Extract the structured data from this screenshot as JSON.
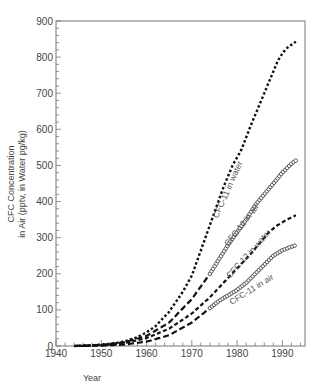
{
  "chart_data": {
    "type": "line",
    "title": "",
    "xlabel": "Year",
    "ylabel": "CFC Concentration\nin Air (pptv, in Water pg/kg)",
    "ylabel_lines": [
      "CFC Concentration",
      "in Air (pptv, in Water pg/kg)"
    ],
    "xlim": [
      1940,
      1995
    ],
    "ylim": [
      0,
      900
    ],
    "x_ticks": [
      1940,
      1950,
      1960,
      1970,
      1980,
      1990
    ],
    "y_ticks": [
      0,
      100,
      200,
      300,
      400,
      500,
      600,
      700,
      800,
      900
    ],
    "grid": false,
    "legend": "inline labels along curves",
    "series": [
      {
        "name": "CFC-11 in water",
        "style": "dotted",
        "x": [
          1944,
          1948,
          1952,
          1955,
          1958,
          1960,
          1962,
          1965,
          1968,
          1970,
          1973,
          1975,
          1977,
          1979,
          1981,
          1983,
          1985,
          1987,
          1989,
          1990,
          1991,
          1993
        ],
        "y": [
          0,
          2,
          6,
          12,
          25,
          38,
          55,
          95,
          150,
          195,
          300,
          370,
          440,
          500,
          545,
          610,
          670,
          730,
          790,
          810,
          825,
          843
        ]
      },
      {
        "name": "CFC-12 in air",
        "style": "circles",
        "x": [
          1944,
          1950,
          1955,
          1960,
          1965,
          1970,
          1972,
          1974,
          1976,
          1978,
          1980,
          1982,
          1984,
          1986,
          1988,
          1990,
          1992,
          1993
        ],
        "y": [
          0,
          3,
          10,
          28,
          65,
          130,
          165,
          200,
          240,
          280,
          315,
          350,
          390,
          420,
          450,
          480,
          505,
          514
        ]
      },
      {
        "name": "CFC-12 in water",
        "style": "dash-dot",
        "x": [
          1944,
          1950,
          1955,
          1960,
          1965,
          1970,
          1974,
          1977,
          1980,
          1983,
          1985,
          1987,
          1989,
          1991,
          1993
        ],
        "y": [
          0,
          2,
          8,
          22,
          48,
          90,
          135,
          175,
          215,
          255,
          285,
          315,
          335,
          350,
          362
        ]
      },
      {
        "name": "CFC-11 in air",
        "style": "circles",
        "x": [
          1944,
          1950,
          1955,
          1960,
          1965,
          1970,
          1972,
          1974,
          1976,
          1978,
          1980,
          1982,
          1984,
          1986,
          1988,
          1990,
          1992,
          1993
        ],
        "y": [
          0,
          1,
          4,
          12,
          30,
          65,
          85,
          105,
          125,
          140,
          155,
          175,
          200,
          225,
          250,
          265,
          275,
          279
        ]
      }
    ],
    "series_labels": [
      {
        "text": "CFC-11 in water",
        "x": 1978.5,
        "y": 430,
        "angle": -66
      },
      {
        "text": "CFC-12 in air",
        "x": 1981.5,
        "y": 330,
        "angle": -52
      },
      {
        "text": "CFC-12 in water",
        "x": 1983,
        "y": 250,
        "angle": -48
      },
      {
        "text": "CFC-11 in air",
        "x": 1983.5,
        "y": 150,
        "angle": -32
      }
    ]
  }
}
